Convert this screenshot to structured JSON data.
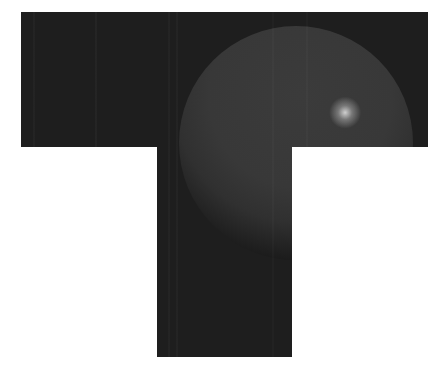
{
  "scene": {
    "description": "Rendered dark T-shaped panel with a shaded gray sphere and specular highlight",
    "background_color": "#ffffff",
    "panel": {
      "color": "#1e1e1e",
      "top_bar": {
        "x": 21,
        "y": 12,
        "width": 407,
        "height": 135
      },
      "stem": {
        "x": 157,
        "y": 147,
        "width": 135,
        "height": 210
      }
    },
    "sphere": {
      "center_x": 296,
      "center_y": 143,
      "radius": 117,
      "body_color": "#393939",
      "shadow_color": "#141414",
      "highlight": {
        "x": 338,
        "y": 84,
        "radius": 12,
        "color": "#c8c8c8"
      }
    }
  }
}
